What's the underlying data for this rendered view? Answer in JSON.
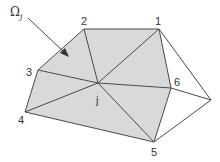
{
  "figure": {
    "region_label": "Ω",
    "region_subscript": "j",
    "center_label": "j",
    "vertex_labels": [
      "1",
      "2",
      "3",
      "4",
      "5",
      "6"
    ],
    "colors": {
      "shaded_region": "#d9d9d9",
      "edges": "#4a4a4a",
      "text": "#333333"
    }
  }
}
